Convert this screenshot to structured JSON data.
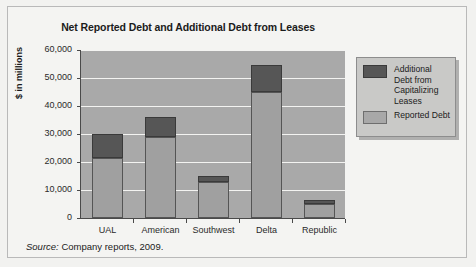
{
  "figure": {
    "source_word": "Source:",
    "source_text": " Company reports, 2009."
  },
  "colors": {
    "additional": "#565656",
    "reported": "#a0a0a0",
    "plot_background": "#a9a9a9",
    "gridline": "#f3f3f1",
    "axis": "#4a4a4a",
    "legend_background": "#c9c9c7",
    "page_background": "#f4f4f2"
  },
  "legend": {
    "position": "right",
    "entries": [
      {
        "label": "Additional Debt from Capitalizing Leases",
        "swatch": "additional"
      },
      {
        "label": "Reported Debt",
        "swatch": "reported"
      }
    ]
  },
  "chart_data": {
    "type": "bar",
    "stacked": true,
    "title": "Net Reported Debt and Additional Debt from Leases",
    "xlabel": "",
    "ylabel": "$ in millions",
    "categories": [
      "UAL",
      "American",
      "Southwest",
      "Delta",
      "Republic"
    ],
    "series": [
      {
        "name": "Reported Debt",
        "values": [
          21500,
          29000,
          13000,
          45000,
          5000
        ]
      },
      {
        "name": "Additional Debt from Capitalizing Leases",
        "values": [
          8500,
          7000,
          2000,
          9500,
          1500
        ]
      }
    ],
    "totals": [
      30000,
      36000,
      15000,
      54500,
      6500
    ],
    "ylim": [
      0,
      60000
    ],
    "ytick_values": [
      0,
      10000,
      20000,
      30000,
      40000,
      50000,
      60000
    ],
    "ytick_labels": [
      "0",
      "10,000",
      "20,000",
      "30,000",
      "40,000",
      "50,000",
      "60,000"
    ],
    "grid": true
  }
}
